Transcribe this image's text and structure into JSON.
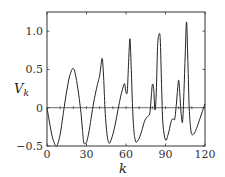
{
  "chart_data": {
    "type": "line",
    "title": "",
    "xlabel": "k",
    "ylabel": "V",
    "ylabel_subscript": "k",
    "xlim": [
      0,
      120
    ],
    "ylim": [
      -0.5,
      1.25
    ],
    "xticks": [
      0,
      30,
      60,
      90,
      120
    ],
    "xtick_labels": [
      "0",
      "30",
      "60",
      "90",
      "120"
    ],
    "yticks": [
      -0.5,
      0,
      0.5,
      1.0
    ],
    "ytick_labels": [
      "−0.5",
      "0",
      "0.5",
      "1.0"
    ],
    "zero_line": true,
    "zero_line_minor_ticks_every": 10,
    "grid": false,
    "legend": null,
    "series": [
      {
        "name": "V_k",
        "color": "#222222",
        "x": [
          0,
          2,
          4,
          6,
          7,
          8,
          10,
          12,
          13,
          15,
          17,
          19,
          20,
          21,
          23,
          25,
          26,
          27,
          28,
          30,
          32,
          34,
          36,
          38,
          39,
          40,
          41,
          42,
          43,
          44,
          45,
          46,
          47,
          48,
          50,
          52,
          54,
          56,
          58,
          59,
          60,
          61,
          62,
          63,
          64,
          65,
          66,
          67,
          68,
          70,
          72,
          74,
          76,
          78,
          79,
          80,
          81,
          82,
          83,
          84,
          85,
          86,
          87,
          88,
          90,
          92,
          94,
          95,
          96,
          97,
          98,
          99,
          100,
          101,
          102,
          103,
          104,
          105,
          106,
          107,
          108,
          109,
          110,
          112,
          114,
          116,
          118,
          120
        ],
        "y": [
          0.0,
          -0.2,
          -0.38,
          -0.48,
          -0.5,
          -0.48,
          -0.35,
          -0.12,
          0.0,
          0.22,
          0.4,
          0.5,
          0.51,
          0.48,
          0.3,
          0.05,
          -0.1,
          -0.3,
          -0.46,
          -0.45,
          -0.3,
          -0.08,
          0.12,
          0.28,
          0.35,
          0.42,
          0.55,
          0.64,
          0.4,
          0.0,
          -0.25,
          -0.4,
          -0.46,
          -0.45,
          -0.35,
          -0.2,
          -0.02,
          0.15,
          0.28,
          0.31,
          0.2,
          0.22,
          0.6,
          0.9,
          0.5,
          0.0,
          -0.3,
          -0.42,
          -0.45,
          -0.4,
          -0.3,
          -0.18,
          -0.12,
          -0.08,
          0.1,
          0.3,
          0.25,
          -0.03,
          0.2,
          0.8,
          0.95,
          0.9,
          0.3,
          -0.2,
          -0.42,
          -0.35,
          -0.2,
          -0.15,
          -0.15,
          -0.15,
          0.0,
          0.2,
          0.36,
          0.15,
          -0.1,
          -0.18,
          0.2,
          0.7,
          1.12,
          0.6,
          0.0,
          -0.25,
          -0.35,
          -0.33,
          -0.25,
          -0.15,
          -0.05,
          0.05
        ]
      }
    ]
  }
}
